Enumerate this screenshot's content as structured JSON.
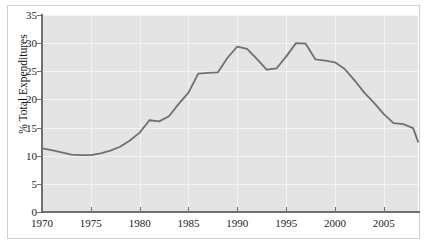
{
  "chart_data": {
    "type": "line",
    "title": "",
    "subtitle": "",
    "xlabel": "",
    "ylabel": "% Total Expenditures",
    "xlim": [
      1970,
      2008.5
    ],
    "ylim": [
      0,
      35
    ],
    "grid": true,
    "legend": null,
    "xticks": [
      1970,
      1975,
      1980,
      1985,
      1990,
      1995,
      2000,
      2005
    ],
    "xtick_labels": [
      "1970",
      "1975",
      "1980",
      "1985",
      "1990",
      "1995",
      "2000",
      "2005"
    ],
    "yticks": [
      0,
      5,
      10,
      15,
      20,
      25,
      30,
      35
    ],
    "ytick_labels": [
      "0",
      "5",
      "10",
      "15",
      "20",
      "25",
      "30",
      "35"
    ],
    "series": [
      {
        "name": "% Total Expenditures",
        "color": "#707070",
        "x": [
          1970,
          1971,
          1972,
          1973,
          1974,
          1975,
          1976,
          1977,
          1978,
          1979,
          1980,
          1981,
          1982,
          1983,
          1984,
          1985,
          1986,
          1987,
          1988,
          1989,
          1990,
          1991,
          1992,
          1993,
          1994,
          1995,
          1996,
          1997,
          1998,
          1999,
          2000,
          2001,
          2002,
          2003,
          2004,
          2005,
          2006,
          2007,
          2008
        ],
        "values": [
          11.3,
          11.0,
          10.6,
          10.2,
          10.1,
          10.1,
          10.4,
          10.9,
          11.6,
          12.7,
          14.1,
          16.3,
          16.1,
          17.0,
          19.2,
          21.2,
          24.6,
          24.7,
          24.8,
          27.4,
          29.4,
          29.0,
          27.2,
          25.3,
          25.5,
          27.6,
          30.0,
          29.9,
          27.1,
          26.9,
          26.6,
          25.4,
          23.4,
          21.2,
          19.4,
          17.4,
          15.8,
          15.6,
          14.9
        ],
        "extra_points_x": [
          2008.5
        ],
        "extra_points_y": [
          12.5
        ]
      }
    ]
  },
  "colors": {
    "plot_background": "#e4e4e4",
    "figure_background": "#ffffff",
    "gridline": "#f4f4f4",
    "axis": "#6f6f6f",
    "line": "#707070",
    "frame": "#cfcfcf",
    "text": "#1a1a1a"
  }
}
